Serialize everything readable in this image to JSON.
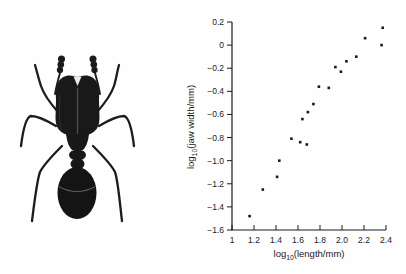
{
  "figure": {
    "background": "#fefefe",
    "ink_color": "#1a1a1a",
    "ant_illustration": {
      "alt": "stippled black ink drawing of an ant (dorsal view, large-headed worker)",
      "body_color": "#181818"
    }
  },
  "chart_data": {
    "type": "scatter",
    "title": "",
    "xlabel": "log10(length/mm)",
    "ylabel": "log10(jaw width/mm)",
    "xlabel_parts": {
      "prefix": "log",
      "sub": "10",
      "rest": "(length/mm)"
    },
    "ylabel_parts": {
      "prefix": "log",
      "sub": "10",
      "rest": "(jaw width/mm)"
    },
    "xlim": [
      1,
      2.4
    ],
    "ylim": [
      -1.6,
      0.2
    ],
    "x_tick_values": [
      1,
      1.2,
      1.4,
      1.6,
      1.8,
      2.0,
      2.2,
      2.4
    ],
    "x_tick_labels": [
      "1",
      "1.2",
      "1.4",
      "1.6",
      "1.8",
      "2.0",
      "2.2",
      "2.4"
    ],
    "y_tick_values": [
      0.2,
      0,
      -0.2,
      -0.4,
      -0.6,
      -0.8,
      -1.0,
      -1.2,
      -1.4,
      -1.6
    ],
    "y_tick_labels": [
      "0.2",
      "0",
      "−0.2",
      "−0.4",
      "−0.6",
      "−0.8",
      "−1.0",
      "−1.2",
      "−1.4",
      "−1.6"
    ],
    "grid": false,
    "legend": null,
    "axis_color": "#1a1a1a",
    "marker": {
      "shape": "square",
      "size": 2.6,
      "color": "#1a1a1a"
    },
    "points": [
      {
        "x": 1.16,
        "y": -1.48
      },
      {
        "x": 1.28,
        "y": -1.25
      },
      {
        "x": 1.41,
        "y": -1.14
      },
      {
        "x": 1.43,
        "y": -1.0
      },
      {
        "x": 1.54,
        "y": -0.81
      },
      {
        "x": 1.62,
        "y": -0.84
      },
      {
        "x": 1.68,
        "y": -0.86
      },
      {
        "x": 1.64,
        "y": -0.64
      },
      {
        "x": 1.69,
        "y": -0.58
      },
      {
        "x": 1.74,
        "y": -0.51
      },
      {
        "x": 1.79,
        "y": -0.36
      },
      {
        "x": 1.88,
        "y": -0.37
      },
      {
        "x": 1.94,
        "y": -0.19
      },
      {
        "x": 1.99,
        "y": -0.23
      },
      {
        "x": 2.04,
        "y": -0.14
      },
      {
        "x": 2.13,
        "y": -0.1
      },
      {
        "x": 2.21,
        "y": 0.06
      },
      {
        "x": 2.36,
        "y": 0.0
      },
      {
        "x": 2.37,
        "y": 0.15
      }
    ]
  }
}
